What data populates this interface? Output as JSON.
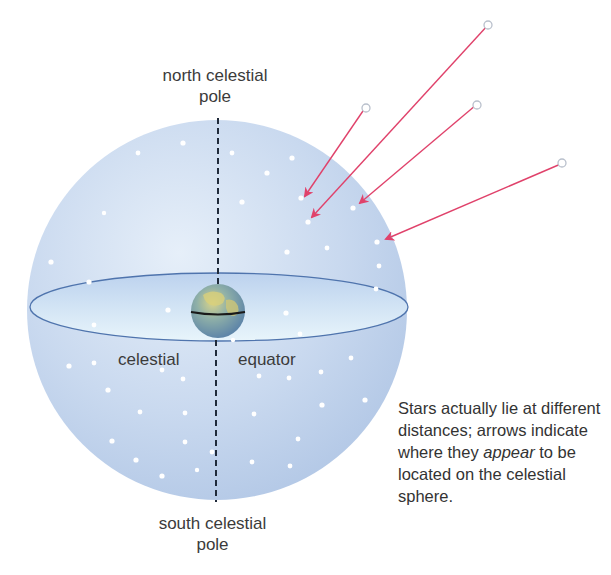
{
  "labels": {
    "north_pole_line1": "north celestial",
    "north_pole_line2": "pole",
    "south_pole_line1": "south celestial",
    "south_pole_line2": "pole",
    "equator_left": "celestial",
    "equator_right": "equator"
  },
  "caption": {
    "part1": "Stars actually lie at different distances; arrows indicate where they ",
    "emphasis": "appear",
    "part2": " to be located on the celestial sphere."
  },
  "colors": {
    "sphere_fill": "#c9d9ef",
    "sphere_edge": "#a9bfe0",
    "equator_plane": "#dfeef9",
    "equator_outline": "#4f74ad",
    "arrow": "#e0426b",
    "axis": "#1f2a3a",
    "star": "#ffffff"
  },
  "arrows": [
    {
      "from": [
        365,
        108
      ],
      "to": [
        303,
        198
      ]
    },
    {
      "from": [
        488,
        25
      ],
      "to": [
        310,
        219
      ]
    },
    {
      "from": [
        476,
        105
      ],
      "to": [
        357,
        205
      ]
    },
    {
      "from": [
        563,
        163
      ],
      "to": [
        383,
        240
      ]
    }
  ]
}
